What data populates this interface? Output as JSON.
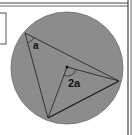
{
  "diagram": {
    "title": "",
    "labels": {
      "inscribed_angle": "a",
      "central_angle": "2a"
    },
    "colors": {
      "circle_fill": "#8c8c8c",
      "stroke": "#2a2a2a",
      "background": "#ffffff",
      "border": "#555555"
    },
    "geometry": {
      "circle": {
        "cx": 67,
        "cy": 68,
        "r": 56
      },
      "center_dot": {
        "x": 67,
        "y": 67
      },
      "vertices": {
        "A": {
          "x": 25,
          "y": 33
        },
        "B": {
          "x": 119,
          "y": 81
        },
        "C": {
          "x": 48,
          "y": 118
        }
      }
    }
  }
}
